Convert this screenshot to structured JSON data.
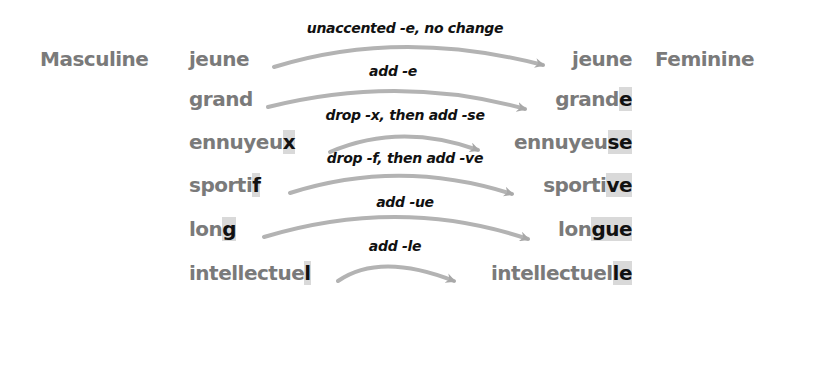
{
  "headers": {
    "masculine": "Masculine",
    "feminine": "Feminine"
  },
  "colors": {
    "word_text": "#7a7a7a",
    "highlight_bg": "#d9d9d9",
    "highlight_text": "#111111",
    "arrow": "#b3b3b3",
    "label_text": "#111111"
  },
  "rows": [
    {
      "rule": "unaccented -e, no change",
      "masc_stem": "jeune",
      "masc_end": "",
      "fem_stem": "jeune",
      "fem_end": ""
    },
    {
      "rule": "add -e",
      "masc_stem": "grand",
      "masc_end": "",
      "fem_stem": "grand",
      "fem_end": "e"
    },
    {
      "rule": "drop -x, then add -se",
      "masc_stem": "ennuyeu",
      "masc_end": "x",
      "fem_stem": "ennuyeu",
      "fem_end": "se"
    },
    {
      "rule": "drop -f, then add -ve",
      "masc_stem": "sporti",
      "masc_end": "f",
      "fem_stem": "sporti",
      "fem_end": "ve"
    },
    {
      "rule": "add -ue",
      "masc_stem": "lon",
      "masc_end": "g",
      "fem_stem": "lon",
      "fem_end": "gue"
    },
    {
      "rule": "add -le",
      "masc_stem": "intellectue",
      "masc_end": "l",
      "fem_stem": "intellectuel",
      "fem_end": "le"
    }
  ]
}
